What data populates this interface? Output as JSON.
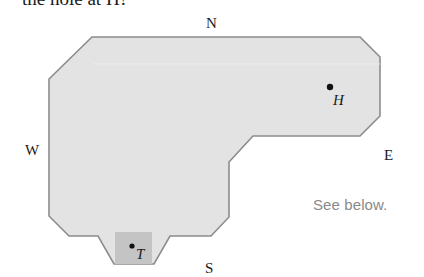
{
  "prompt": {
    "text": "the hole at H?"
  },
  "compass": {
    "north": "N",
    "south": "S",
    "west": "W",
    "east": "E"
  },
  "points": {
    "hole": {
      "label": "H"
    },
    "tee": {
      "label": "T"
    }
  },
  "note": {
    "text": "See below."
  },
  "colors": {
    "course_fill": "#e3e3e3",
    "course_stroke": "#8c8c8c",
    "tee_box_fill": "#c4c4c4",
    "point": "#111111",
    "note_text": "#8a8a8a"
  }
}
